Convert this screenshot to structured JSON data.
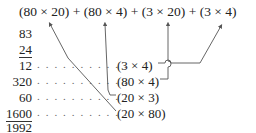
{
  "expression": {
    "text": "(80 × 20) + (80 × 4) + (3 × 20) + (3 × 4)",
    "terms": [
      "(80 × 20)",
      "(80 × 4)",
      "(3 × 20)",
      "(3 × 4)"
    ],
    "operator": "+"
  },
  "multiplication": {
    "multiplicand": "83",
    "multiplier": "24",
    "partial_products": [
      {
        "value": "12",
        "label": "(3 × 4)"
      },
      {
        "value": "320",
        "label": "(80 × 4)"
      },
      {
        "value": "60",
        "label": "(20 × 3)"
      },
      {
        "value": "1600",
        "label": "(20 × 80)"
      }
    ],
    "total": "1992"
  },
  "leader_dots": ". . . . . . . . . . .",
  "colors": {
    "text": "#222222",
    "lines": "#555555",
    "dots": "#666666"
  }
}
